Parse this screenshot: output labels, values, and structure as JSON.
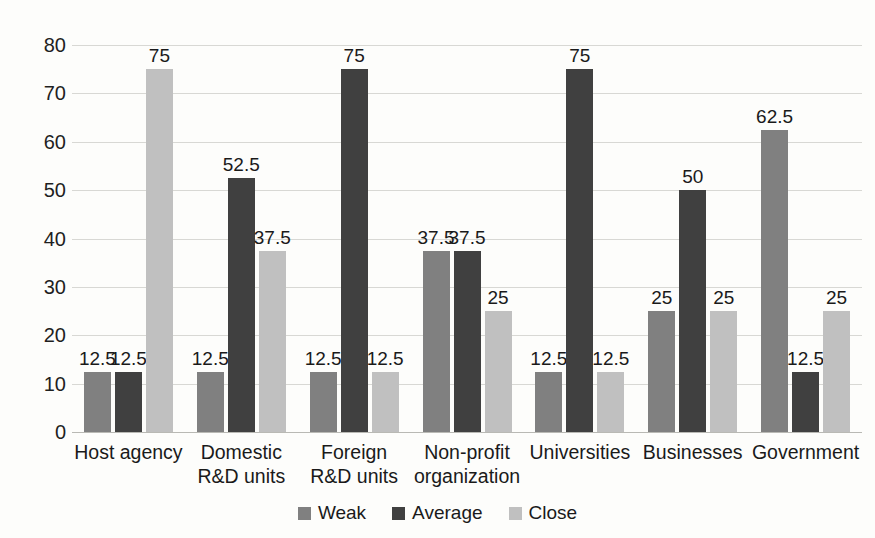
{
  "chart_data": {
    "type": "bar",
    "title": "",
    "subtitle": "",
    "xlabel": "",
    "ylabel": "",
    "ylim": [
      0,
      80
    ],
    "ytick_step": 10,
    "yticks": [
      "80",
      "70",
      "60",
      "50",
      "40",
      "30",
      "20",
      "10",
      "0"
    ],
    "grid": true,
    "legend_position": "bottom",
    "categories": [
      "Host agency",
      "Domestic R&D units",
      "Foreign R&D units",
      "Non-profit organization",
      "Universities",
      "Businesses",
      "Government"
    ],
    "series": [
      {
        "name": "Weak",
        "color": "#808080",
        "values": [
          12.5,
          12.5,
          12.5,
          37.5,
          12.5,
          25,
          62.5
        ],
        "labels": [
          "12.5",
          "12.5",
          "12.5",
          "37.5",
          "12.5",
          "25",
          "62.5"
        ]
      },
      {
        "name": "Average",
        "color": "#404040",
        "values": [
          12.5,
          52.5,
          75,
          37.5,
          75,
          50,
          12.5
        ],
        "labels": [
          "12.5",
          "52.5",
          "75",
          "37.5",
          "75",
          "50",
          "12.5"
        ]
      },
      {
        "name": "Close",
        "color": "#c0c0c0",
        "values": [
          75,
          37.5,
          12.5,
          25,
          12.5,
          25,
          25
        ],
        "labels": [
          "75",
          "37.5",
          "12.5",
          "25",
          "12.5",
          "25",
          "25"
        ]
      }
    ]
  },
  "legend": {
    "items": [
      {
        "label": "Weak",
        "color": "#808080"
      },
      {
        "label": "Average",
        "color": "#404040"
      },
      {
        "label": "Close",
        "color": "#c0c0c0"
      }
    ]
  },
  "colors": {
    "background": "#fdfdfb",
    "gridline": "#d8d8d4",
    "axis_text": "#1f1f1f"
  }
}
